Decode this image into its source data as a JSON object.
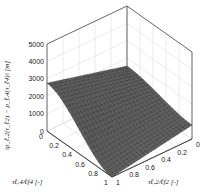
{
  "chart_data": {
    "type": "surface",
    "title": "",
    "zlabel": "||p_{ℓ,2}(τ_{ℓ2}) − p_{ℓ,4}(τ_{ℓ4})|| [m]",
    "xlabel": "τ_{ℓ4}/ℓ_{f4} [-]",
    "ylabel": "τ_{ℓ2}/ℓ_{f2} [-]",
    "zlim": [
      0,
      5000
    ],
    "xlim": [
      0,
      1
    ],
    "ylim": [
      0,
      1
    ],
    "z_ticks": [
      "0",
      "1000",
      "2000",
      "3000",
      "4000",
      "5000"
    ],
    "x_ticks": [
      "0",
      "0.2",
      "0.4",
      "0.6",
      "0.8",
      "1"
    ],
    "y_ticks": [
      "0",
      "0.2",
      "0.4",
      "0.6",
      "0.8",
      "1"
    ],
    "grid": true,
    "corner_values": [
      {
        "x": 0,
        "y": 0,
        "z": 1550
      },
      {
        "x": 0,
        "y": 1,
        "z": 2750
      },
      {
        "x": 1,
        "y": 0,
        "z": 800
      },
      {
        "x": 1,
        "y": 1,
        "z": 0
      }
    ],
    "colormap": "gray"
  },
  "labels": {
    "zlabel_text": "‖p_ℓ,2(τ_ℓ2) − p_ℓ,4(τ_ℓ4)‖ [m]",
    "xlabel_text": "τℓ,4/ℓf4 [-]",
    "ylabel_text": "τℓ,2/ℓf2 [-]"
  }
}
